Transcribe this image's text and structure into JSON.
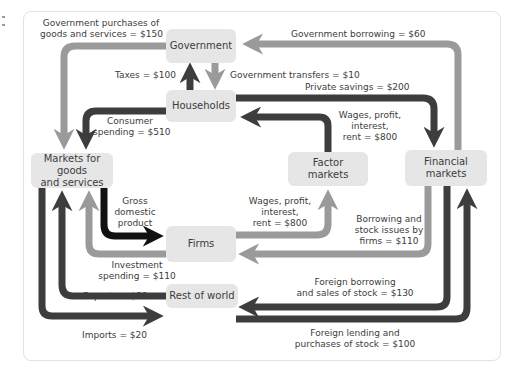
{
  "colors": {
    "dark_flow": "#3d3d3d",
    "medium_flow": "#9a9a9a",
    "black_flow": "#111111",
    "node_fill": "#e6e6e6",
    "panel_border": "#e2e2e2",
    "text": "#3c3c3c"
  },
  "nodes": {
    "government": "Government",
    "households": "Households",
    "markets_goods_line1": "Markets for goods",
    "markets_goods_line2": "and services",
    "factor_line1": "Factor",
    "factor_line2": "markets",
    "financial_line1": "Financial",
    "financial_line2": "markets",
    "firms": "Firms",
    "rest_of_world": "Rest of world"
  },
  "flows": {
    "gov_purchases_line1": "Government purchases of",
    "gov_purchases_line2": "goods and services = $150",
    "gov_borrowing": "Government borrowing = $60",
    "taxes": "Taxes = $100",
    "gov_transfers": "Government transfers = $10",
    "private_savings": "Private savings = $200",
    "consumer_spending_line1": "Consumer",
    "consumer_spending_line2": "spending = $510",
    "wages_hh_line1": "Wages, profit,",
    "wages_hh_line2": "interest,",
    "wages_hh_line3": "rent = $800",
    "gdp_line1": "Gross",
    "gdp_line2": "domestic",
    "gdp_line3": "product",
    "wages_firms_line1": "Wages, profit,",
    "wages_firms_line2": "interest,",
    "wages_firms_line3": "rent = $800",
    "borrowing_firms_line1": "Borrowing and",
    "borrowing_firms_line2": "stock issues by",
    "borrowing_firms_line3": "firms = $110",
    "investment_line1": "Investment",
    "investment_line2": "spending = $110",
    "exports": "Exports = $50",
    "imports": "Imports = $20",
    "foreign_borrowing_line1": "Foreign borrowing",
    "foreign_borrowing_line2": "and sales of stock = $130",
    "foreign_lending_line1": "Foreign lending and",
    "foreign_lending_line2": "purchases of stock = $100"
  }
}
